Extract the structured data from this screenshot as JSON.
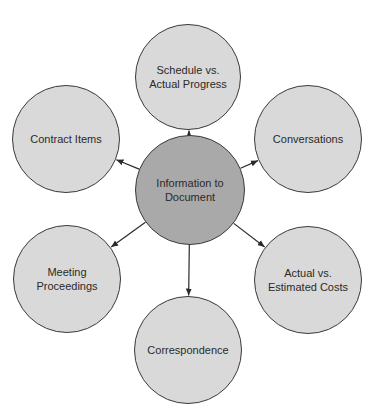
{
  "diagram": {
    "type": "hub-and-spoke",
    "center": {
      "label": "Information to\nDocument",
      "fill": "#a9a9a9",
      "cx": 190,
      "cy": 190,
      "r": 55
    },
    "nodes": [
      {
        "id": "schedule",
        "label": "Schedule vs.\nActual Progress",
        "cx": 188,
        "cy": 77,
        "r": 53
      },
      {
        "id": "contract-items",
        "label": "Contract Items",
        "cx": 66,
        "cy": 139,
        "r": 54
      },
      {
        "id": "conversations",
        "label": "Conversations",
        "cx": 308,
        "cy": 139,
        "r": 54
      },
      {
        "id": "meeting-proceedings",
        "label": "Meeting\nProceedings",
        "cx": 67,
        "cy": 279,
        "r": 54
      },
      {
        "id": "actual-vs-estimated",
        "label": "Actual vs.\nEstimated Costs",
        "cx": 308,
        "cy": 280,
        "r": 54
      },
      {
        "id": "correspondence",
        "label": "Correspondence",
        "cx": 188,
        "cy": 350,
        "r": 54
      }
    ],
    "outer_fill": "#d9d9d9",
    "stroke": "#3a3a3a",
    "edge_direction": "center-to-outer"
  }
}
